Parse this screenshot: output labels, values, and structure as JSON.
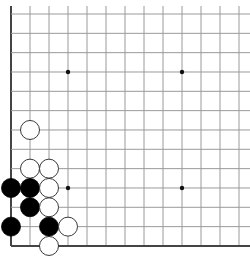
{
  "board": {
    "grid_cols": 13,
    "grid_rows": 13,
    "origin_x": 11,
    "origin_y": 14,
    "spacing_x": 19,
    "spacing_y": 19.33,
    "edges": {
      "left": true,
      "bottom": true,
      "top": false,
      "right": false
    },
    "line_color": "#9a9a9a",
    "edge_color": "#444444",
    "star_points": [
      [
        3,
        3
      ],
      [
        9,
        3
      ],
      [
        3,
        9
      ],
      [
        9,
        9
      ]
    ],
    "stone_radius": 9.5
  },
  "stones": [
    {
      "color": "white",
      "col": 1,
      "row": 6
    },
    {
      "color": "white",
      "col": 1,
      "row": 8
    },
    {
      "color": "white",
      "col": 2,
      "row": 8
    },
    {
      "color": "black",
      "col": 0,
      "row": 9
    },
    {
      "color": "black",
      "col": 1,
      "row": 9
    },
    {
      "color": "white",
      "col": 2,
      "row": 9
    },
    {
      "color": "black",
      "col": 1,
      "row": 10
    },
    {
      "color": "white",
      "col": 2,
      "row": 10
    },
    {
      "color": "black",
      "col": 0,
      "row": 11
    },
    {
      "color": "black",
      "col": 2,
      "row": 11
    },
    {
      "color": "white",
      "col": 3,
      "row": 11
    },
    {
      "color": "white",
      "col": 2,
      "row": 12
    }
  ]
}
